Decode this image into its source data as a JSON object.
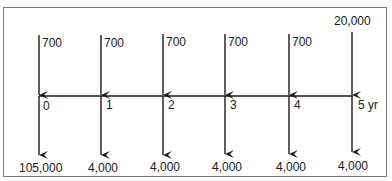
{
  "diagram": {
    "time_unit": "yr",
    "periods": [
      {
        "label": "0",
        "inflow": "700",
        "outflow": "105,000"
      },
      {
        "label": "1",
        "inflow": "700",
        "outflow": "4,000"
      },
      {
        "label": "2",
        "inflow": "700",
        "outflow": "4,000"
      },
      {
        "label": "3",
        "inflow": "700",
        "outflow": "4,000"
      },
      {
        "label": "4",
        "inflow": "700",
        "outflow": "4,000"
      },
      {
        "label": "5 yr",
        "inflow": "20,000",
        "outflow": "4,000"
      }
    ],
    "colors": {
      "line": "#1a1a1a",
      "frame": "#7a7a7a",
      "background": "#ffffff"
    }
  }
}
